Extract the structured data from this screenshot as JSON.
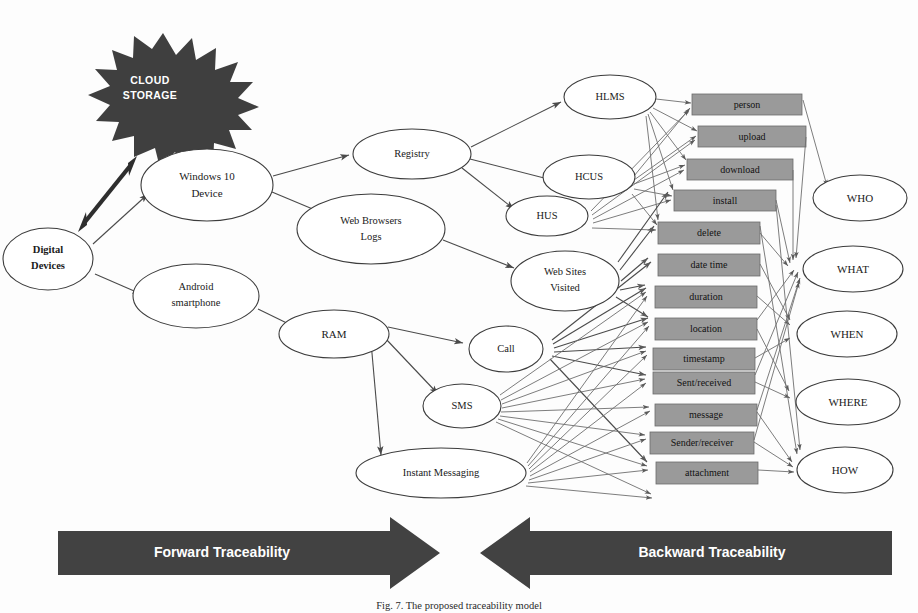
{
  "figure": {
    "caption": "Fig. 7. The proposed traceability model",
    "cloud": {
      "line1": "CLOUD",
      "line2": "STORAGE"
    },
    "colors": {
      "attribute_box_fill": "#9a9a9a",
      "attribute_box_stroke": "#6b6b6b",
      "band_fill": "#424242",
      "cloud_fill": "#3f3f3f",
      "edge": "#6e6e6e",
      "node_stroke": "#3c3c3c",
      "node_fill": "#ffffff",
      "text": "#121212"
    }
  },
  "sources": {
    "root": {
      "line1": "Digital",
      "line2": "Devices"
    },
    "devices": [
      {
        "id": "win10",
        "line1": "Windows 10",
        "line2": "Device"
      },
      {
        "id": "android",
        "line1": "Android",
        "line2": "smartphone"
      }
    ]
  },
  "artifacts": [
    {
      "id": "registry",
      "line1": "Registry",
      "line2": ""
    },
    {
      "id": "browserlogs",
      "line1": "Web Browsers",
      "line2": "Logs"
    },
    {
      "id": "ram",
      "line1": "RAM",
      "line2": ""
    }
  ],
  "evidence": [
    {
      "id": "hlms",
      "line1": "HLMS",
      "line2": ""
    },
    {
      "id": "hcus",
      "line1": "HCUS",
      "line2": ""
    },
    {
      "id": "hus",
      "line1": "HUS",
      "line2": ""
    },
    {
      "id": "websites",
      "line1": "Web Sites",
      "line2": "Visited"
    },
    {
      "id": "call",
      "line1": "Call",
      "line2": ""
    },
    {
      "id": "sms",
      "line1": "SMS",
      "line2": ""
    },
    {
      "id": "im",
      "line1": "Instant Messaging",
      "line2": ""
    }
  ],
  "attributes": [
    {
      "id": "person",
      "label": "person"
    },
    {
      "id": "upload",
      "label": "upload"
    },
    {
      "id": "download",
      "label": "download"
    },
    {
      "id": "install",
      "label": "install"
    },
    {
      "id": "delete",
      "label": "delete"
    },
    {
      "id": "datetime",
      "label": "date time"
    },
    {
      "id": "duration",
      "label": "duration"
    },
    {
      "id": "location",
      "label": "location"
    },
    {
      "id": "timestamp",
      "label": "timestamp"
    },
    {
      "id": "sentreceived",
      "label": "Sent/received"
    },
    {
      "id": "message",
      "label": "message"
    },
    {
      "id": "senderreceiver",
      "label": "Sender/receiver"
    },
    {
      "id": "attachment",
      "label": "attachment"
    }
  ],
  "questions": [
    {
      "id": "who",
      "label": "WHO"
    },
    {
      "id": "what",
      "label": "WHAT"
    },
    {
      "id": "when",
      "label": "WHEN"
    },
    {
      "id": "where",
      "label": "WHERE"
    },
    {
      "id": "how",
      "label": "HOW"
    }
  ],
  "bands": {
    "forward": "Forward Traceability",
    "backward": "Backward Traceability"
  }
}
